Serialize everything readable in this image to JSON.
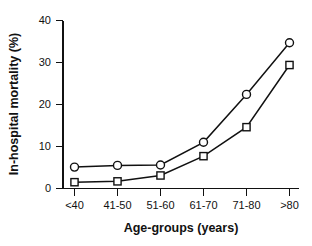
{
  "chart_data": {
    "type": "line",
    "title": "",
    "xlabel": "Age-groups (years)",
    "ylabel": "In-hospital mortality (%)",
    "categories": [
      "<40",
      "41-50",
      "51-60",
      "61-70",
      "71-80",
      ">80"
    ],
    "ytick_labels": [
      "0",
      "10",
      "20",
      "30",
      "40"
    ],
    "ytick_values": [
      0,
      10,
      20,
      30,
      40
    ],
    "ylim": [
      0,
      40
    ],
    "grid": false,
    "legend": "none",
    "series": [
      {
        "name": "circle-series",
        "marker": "open-circle",
        "values": [
          5.1,
          5.5,
          5.6,
          11.0,
          22.4,
          34.7
        ]
      },
      {
        "name": "square-series",
        "marker": "open-square",
        "values": [
          1.5,
          1.7,
          3.1,
          7.7,
          14.6,
          29.4
        ]
      }
    ]
  },
  "axis": {
    "x_title": "Age-groups (years)",
    "y_title": "In-hospital mortality (%)"
  },
  "colors": {
    "ink": "#111111",
    "background": "#ffffff",
    "marker_fill": "#ffffff"
  }
}
